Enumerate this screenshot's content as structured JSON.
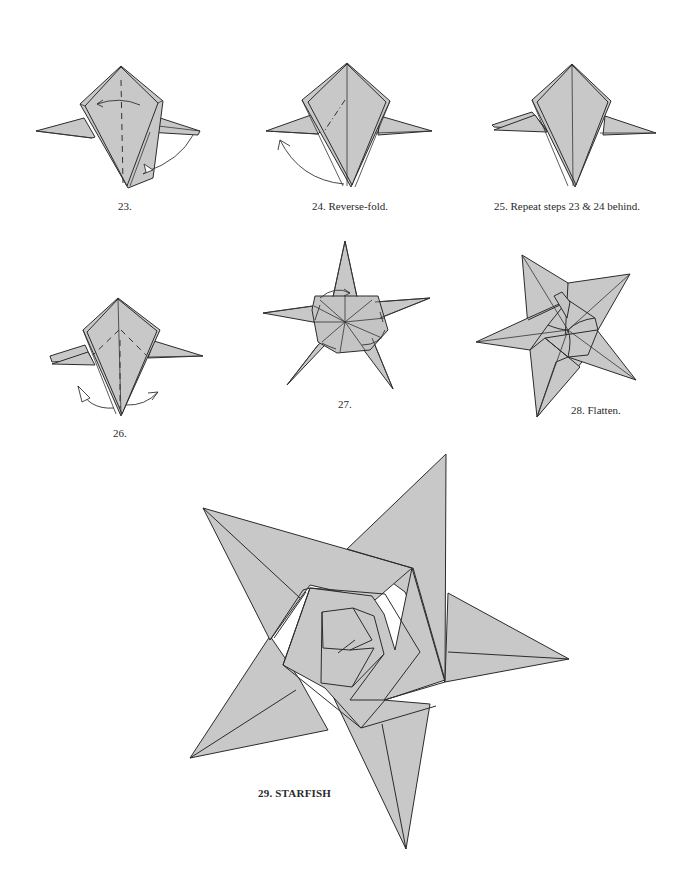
{
  "page": {
    "type": "origami instruction diagram page",
    "paper_color": "#c8c8c8",
    "line_color": "#2b2b2b",
    "background": "#ffffff"
  },
  "steps": [
    {
      "number": "23",
      "caption": "23.",
      "icon": "valley-fold-arrow-icon"
    },
    {
      "number": "24",
      "caption": "24.  Reverse-fold.",
      "icon": "reverse-fold-arrow-icon"
    },
    {
      "number": "25",
      "caption": "25.  Repeat steps 23 & 24 behind.",
      "icon": ""
    },
    {
      "number": "26",
      "caption": "26.",
      "icon": "unfold-arrows-icon"
    },
    {
      "number": "27",
      "caption": "27.",
      "icon": "swivel-arrows-icon"
    },
    {
      "number": "28",
      "caption": "28.  Flatten.",
      "icon": "flatten-arrow-icon"
    },
    {
      "number": "29",
      "caption": "29.  STARFISH",
      "icon": ""
    }
  ]
}
